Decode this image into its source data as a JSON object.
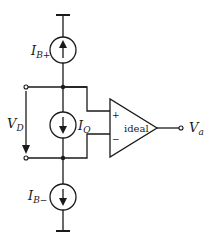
{
  "diagram": {
    "type": "circuit-schematic",
    "labels": {
      "ib_plus_main": "I",
      "ib_plus_sub": "B+",
      "io_main": "I",
      "io_sub": "O",
      "ib_minus_main": "I",
      "ib_minus_sub": "B−",
      "vd_main": "V",
      "vd_sub": "D",
      "va_main": "V",
      "va_sub": "a",
      "opamp_text": "ideal",
      "plus_sign": "+",
      "minus_sign": "−"
    },
    "components": [
      {
        "name": "current-source-ib-plus",
        "direction": "up"
      },
      {
        "name": "current-source-io",
        "direction": "down"
      },
      {
        "name": "current-source-ib-minus",
        "direction": "down"
      },
      {
        "name": "opamp",
        "label": "ideal"
      }
    ],
    "colors": {
      "stroke": "#1a1a1a",
      "background": "#ffffff"
    }
  }
}
